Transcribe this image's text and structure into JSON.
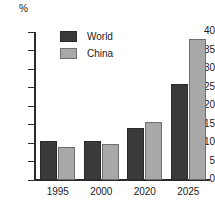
{
  "chart_data": {
    "type": "bar",
    "title": "",
    "subtitle": "",
    "xlabel": "",
    "ylabel": "%",
    "categories": [
      "1995",
      "2000",
      "2020",
      "2025"
    ],
    "series": [
      {
        "name": "World",
        "color": "#3a3a3a",
        "values": [
          10.5,
          10.5,
          14.0,
          26.0
        ]
      },
      {
        "name": "China",
        "color": "#a8a8a8",
        "values": [
          9.0,
          9.8,
          15.8,
          38.0
        ]
      }
    ],
    "ylim": [
      0,
      40
    ],
    "ytick_step": 5,
    "yticks": [
      40,
      35,
      30,
      25,
      20,
      15,
      10,
      5,
      0
    ],
    "ytick_labels": [
      "40",
      "35",
      "30",
      "25",
      "20",
      "15",
      "10",
      "5",
      "0"
    ],
    "grid": false,
    "legend_position": "top-left-inside",
    "legend": [
      {
        "label": "World",
        "color": "#3a3a3a"
      },
      {
        "label": "China",
        "color": "#a8a8a8"
      }
    ],
    "axis_color": "#2b2b2b",
    "background": "#ffffff"
  }
}
